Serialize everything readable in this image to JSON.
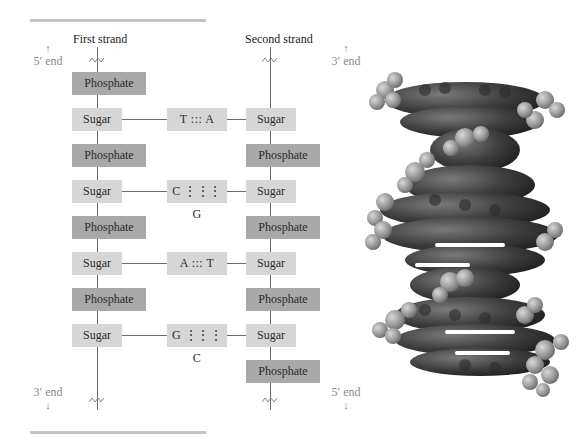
{
  "diagram": {
    "first_strand": {
      "title": "First strand",
      "top_end": "5′ end",
      "bottom_end": "3′ end",
      "units": [
        "Phosphate",
        "Sugar",
        "Phosphate",
        "Sugar",
        "Phosphate",
        "Sugar",
        "Phosphate",
        "Sugar"
      ]
    },
    "second_strand": {
      "title": "Second strand",
      "top_end": "3′ end",
      "bottom_end": "5′ end",
      "units": [
        "Sugar",
        "Phosphate",
        "Sugar",
        "Phosphate",
        "Sugar",
        "Phosphate",
        "Sugar",
        "Phosphate"
      ]
    },
    "base_pairs": [
      "T ::: A",
      "C ⋮⋮⋮ G",
      "A ::: T",
      "G ⋮⋮⋮ C"
    ],
    "arrows": {
      "up": "↑",
      "down": "↓"
    },
    "colors": {
      "sugar_box": "#d6d6d6",
      "phosphate_box": "#a9a9a9",
      "rule": "#c4c4c4",
      "line": "#6c6c6c",
      "end_label": "#8a8a8a"
    },
    "image": {
      "subject": "space-filling model of DNA double helix"
    }
  }
}
